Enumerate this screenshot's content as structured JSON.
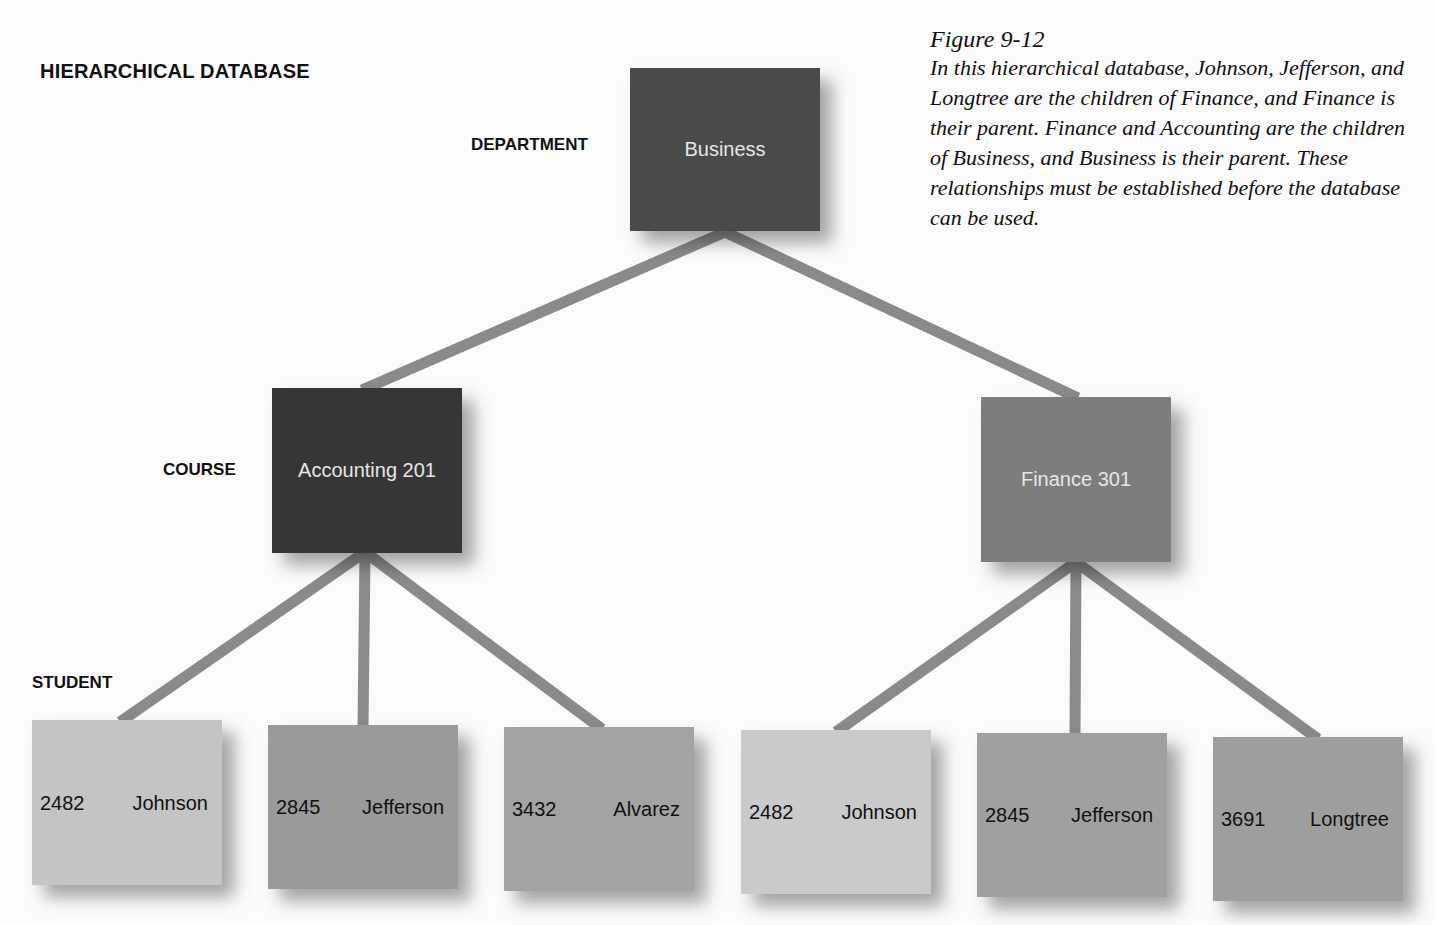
{
  "title": "HIERARCHICAL DATABASE",
  "levels": {
    "department": "DEPARTMENT",
    "course": "COURSE",
    "student": "STUDENT"
  },
  "caption": {
    "figure": "Figure 9-12",
    "text": "In this hierarchical database, Johnson, Jefferson, and Longtree are the children of Finance, and Finance is their parent. Finance and Accounting are the children of Business, and Business is their parent. These relationships must be established before the database can be used."
  },
  "department": {
    "label": "Business",
    "color": "#4a4a4a"
  },
  "courses": [
    {
      "label": "Accounting 201",
      "color": "#363636"
    },
    {
      "label": "Finance 301",
      "color": "#7d7d7d"
    }
  ],
  "students": [
    {
      "id": "2482",
      "name": "Johnson",
      "color": "#c4c4c4"
    },
    {
      "id": "2845",
      "name": "Jefferson",
      "color": "#9a9a9a"
    },
    {
      "id": "3432",
      "name": "Alvarez",
      "color": "#a3a3a3"
    },
    {
      "id": "2482",
      "name": "Johnson",
      "color": "#cacaca"
    },
    {
      "id": "2845",
      "name": "Jefferson",
      "color": "#a0a0a0"
    },
    {
      "id": "3691",
      "name": "Longtree",
      "color": "#9e9e9e"
    }
  ],
  "link_color": "#8a8a8a"
}
